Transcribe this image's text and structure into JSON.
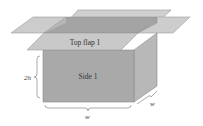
{
  "diagram": {
    "type": "open-box-3d",
    "labels": {
      "top_flap": "Top flap 1",
      "side": "Side 1",
      "height": "2h",
      "width_front": "w",
      "width_depth": "w"
    },
    "colors": {
      "front_face": "#a9a9a9",
      "right_face": "#b9b9b9",
      "interior_back": "#9a9a9a",
      "interior_left": "#b2b2b2",
      "flap": "#c8c8c8",
      "flap_front": "#c9c9c9",
      "edge": "#8a8a8a",
      "brace": "#888888",
      "text": "#333333"
    }
  }
}
